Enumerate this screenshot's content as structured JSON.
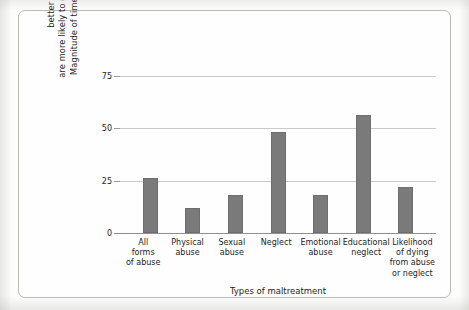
{
  "figure": {
    "frame_color": "#b9b9b6",
    "bar_color": "#7a7a7a",
    "grid_color": "#c9c9c9"
  },
  "chart_data": {
    "type": "bar",
    "title": "",
    "xlabel": "Types of maltreatment",
    "ylabel": "Magnitude of times that children from poorer families are more likely to experience abuse than children from better economic circumstances",
    "ylabel_lines": [
      "Magnitude of times that children from poorer families",
      "are more likely to experience abuse than children from",
      "better economic circumstances"
    ],
    "categories": [
      "All forms of abuse",
      "Physical abuse",
      "Sexual abuse",
      "Neglect",
      "Emotional abuse",
      "Educational neglect",
      "Likelihood of dying from abuse or neglect"
    ],
    "category_lines": [
      [
        "All",
        "forms",
        "of abuse"
      ],
      [
        "Physical",
        "abuse"
      ],
      [
        "Sexual",
        "abuse"
      ],
      [
        "Neglect"
      ],
      [
        "Emotional",
        "abuse"
      ],
      [
        "Educational",
        "neglect"
      ],
      [
        "Likelihood",
        "of dying",
        "from abuse",
        "or neglect"
      ]
    ],
    "values": [
      26,
      12,
      18,
      48,
      18,
      56,
      22
    ],
    "ylim": [
      0,
      80
    ],
    "yticks": [
      0,
      25,
      50,
      75
    ],
    "ytick_labels": [
      "0",
      "25",
      "50",
      "75"
    ],
    "grid": "horizontal",
    "legend": "none"
  }
}
